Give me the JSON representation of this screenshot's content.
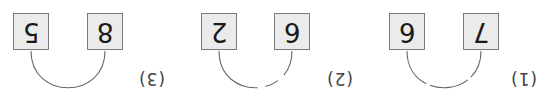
{
  "orientation": "rotated-180",
  "colors": {
    "box_fill": "#ebebeb",
    "box_border": "#7a7a7a",
    "arc": "#666666",
    "text": "#1a1a1a"
  },
  "problems": [
    {
      "label": "(3)",
      "left": "5",
      "right": "8",
      "blank": ""
    },
    {
      "label": "(2)",
      "left": "2",
      "right": "6",
      "blank": "_"
    },
    {
      "label": "(1)",
      "left": "6",
      "right": "7",
      "blank": ""
    }
  ]
}
